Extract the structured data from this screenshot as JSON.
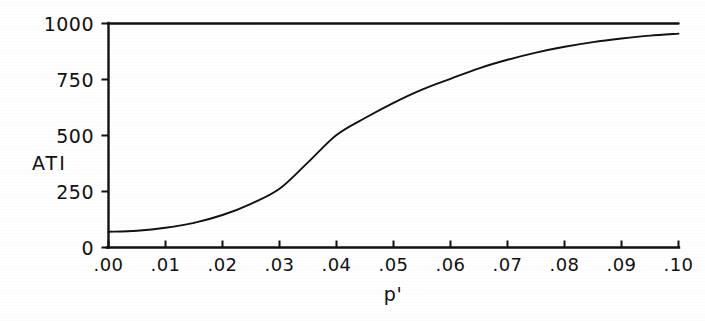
{
  "figure": {
    "background_color": "#ffffff",
    "ink_color": "#111111"
  },
  "chart_data": {
    "type": "line",
    "title": "",
    "subtitle": "",
    "xlabel": "p'",
    "ylabel": "ATI",
    "xlim": [
      0.0,
      0.1
    ],
    "ylim": [
      0,
      1000
    ],
    "grid": false,
    "legend": null,
    "x_tick_labels": [
      ".00",
      ".01",
      ".02",
      ".03",
      ".04",
      ".05",
      ".06",
      ".07",
      ".08",
      ".09",
      ".10"
    ],
    "x_tick_values": [
      0.0,
      0.01,
      0.02,
      0.03,
      0.04,
      0.05,
      0.06,
      0.07,
      0.08,
      0.09,
      0.1
    ],
    "y_tick_labels": [
      "0",
      "250",
      "500",
      "750",
      "1000"
    ],
    "y_tick_values": [
      0,
      250,
      500,
      750,
      1000
    ],
    "series": [
      {
        "name": "ATI curve",
        "style": "solid",
        "color": "#111111",
        "x": [
          0.0,
          0.005,
          0.01,
          0.015,
          0.02,
          0.025,
          0.03,
          0.035,
          0.04,
          0.045,
          0.05,
          0.055,
          0.06,
          0.065,
          0.07,
          0.075,
          0.08,
          0.085,
          0.09,
          0.095,
          0.1
        ],
        "values": [
          70,
          75,
          88,
          110,
          145,
          195,
          262,
          380,
          502,
          578,
          646,
          705,
          753,
          800,
          838,
          870,
          896,
          917,
          933,
          946,
          955
        ]
      },
      {
        "name": "Upper bound n=1000",
        "style": "solid",
        "color": "#111111",
        "x": [
          0.0,
          0.1
        ],
        "values": [
          1000,
          1000
        ]
      }
    ]
  },
  "axes": {
    "x_axis_name": "p-prime-axis",
    "y_axis_name": "ati-axis"
  }
}
